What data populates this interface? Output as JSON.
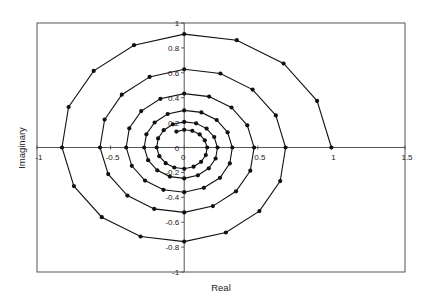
{
  "chart_data": {
    "type": "scatter",
    "title": "",
    "xlabel": "Real",
    "ylabel": "Imaginary",
    "xlim": [
      -1,
      1.5
    ],
    "ylim": [
      -1,
      1
    ],
    "grid": false,
    "legend": null,
    "x_ticks": [
      -1,
      -0.5,
      0,
      0.5,
      1,
      1.5
    ],
    "x_tick_labels": [
      "-1",
      "-0.5",
      "0",
      "0.5",
      "1",
      "1.5"
    ],
    "y_ticks": [
      -1,
      -0.8,
      -0.6,
      -0.4,
      -0.2,
      0,
      0.2,
      0.4,
      0.6,
      0.8,
      1
    ],
    "y_tick_labels": [
      "-1",
      "-0.8",
      "-0.6",
      "-0.4",
      "-0.2",
      "0",
      "0.2",
      "0.4",
      "0.6",
      "0.8",
      "1"
    ],
    "style": {
      "line_color": "#111111",
      "marker_color": "#111111",
      "axis_color": "#555555",
      "marker": "circle",
      "connected": true
    },
    "series": [
      {
        "name": "spiral",
        "x": [
          1.0,
          0.903,
          0.675,
          0.357,
          0.0,
          -0.341,
          -0.615,
          -0.785,
          -0.83,
          -0.749,
          -0.56,
          -0.296,
          0.0,
          0.283,
          0.511,
          0.652,
          0.689,
          0.622,
          0.465,
          0.246,
          0.0,
          -0.235,
          -0.424,
          -0.541,
          -0.572,
          -0.516,
          -0.386,
          -0.204,
          0.0,
          0.195,
          0.352,
          0.449,
          0.475,
          0.429,
          0.321,
          0.169,
          0.0,
          -0.162,
          -0.292,
          -0.373,
          -0.394,
          -0.356,
          -0.266,
          -0.141,
          0.0,
          0.134,
          0.243,
          0.31,
          0.327,
          0.295,
          0.221,
          0.117,
          0.0,
          -0.112,
          -0.201,
          -0.257,
          -0.272,
          -0.245,
          -0.183,
          -0.097,
          0.0,
          0.093,
          0.167,
          0.213,
          0.226,
          0.204,
          0.152,
          0.081,
          0.0,
          -0.077,
          -0.139,
          -0.177,
          -0.187,
          -0.169,
          -0.126,
          -0.067,
          0.0,
          0.064,
          0.115,
          0.147,
          0.156,
          0.14,
          0.105,
          0.055,
          0.0,
          -0.053
        ],
        "y": [
          0.0,
          0.374,
          0.675,
          0.862,
          0.911,
          0.822,
          0.615,
          0.325,
          0.0,
          -0.31,
          -0.56,
          -0.715,
          -0.756,
          -0.683,
          -0.511,
          -0.27,
          0.0,
          0.258,
          0.465,
          0.594,
          0.628,
          0.567,
          0.424,
          0.224,
          0.0,
          -0.214,
          -0.386,
          -0.493,
          -0.521,
          -0.471,
          -0.352,
          -0.186,
          0.0,
          0.178,
          0.321,
          0.409,
          0.433,
          0.391,
          0.292,
          0.154,
          0.0,
          -0.147,
          -0.266,
          -0.34,
          -0.359,
          -0.324,
          -0.243,
          -0.128,
          0.0,
          0.122,
          0.221,
          0.282,
          0.298,
          0.269,
          0.201,
          0.106,
          0.0,
          -0.102,
          -0.183,
          -0.234,
          -0.248,
          -0.223,
          -0.167,
          -0.088,
          0.0,
          0.084,
          0.152,
          0.194,
          0.206,
          0.186,
          0.139,
          0.073,
          0.0,
          -0.07,
          -0.126,
          -0.161,
          -0.171,
          -0.154,
          -0.115,
          -0.061,
          0.0,
          0.058,
          0.105,
          0.134,
          0.142,
          0.128
        ]
      }
    ]
  }
}
